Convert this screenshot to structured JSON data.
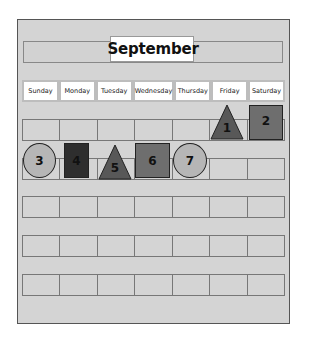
{
  "calendar": {
    "month": "September",
    "month_icon": "apple-icon",
    "days": [
      "Sunday",
      "Monday",
      "Tuesday",
      "Wednesday",
      "Thursday",
      "Friday",
      "Saturday"
    ],
    "rows": 6
  },
  "pieces": [
    {
      "label": "1",
      "shape": "triangle",
      "color": "#585858"
    },
    {
      "label": "2",
      "shape": "square",
      "color": "#6e6e6e"
    },
    {
      "label": "3",
      "shape": "circle",
      "color": "#b6b6b6"
    },
    {
      "label": "4",
      "shape": "rectangle",
      "color": "#2e2e2e"
    },
    {
      "label": "5",
      "shape": "triangle",
      "color": "#585858"
    },
    {
      "label": "6",
      "shape": "square",
      "color": "#6e6e6e"
    },
    {
      "label": "7",
      "shape": "circle",
      "color": "#b6b6b6"
    }
  ]
}
